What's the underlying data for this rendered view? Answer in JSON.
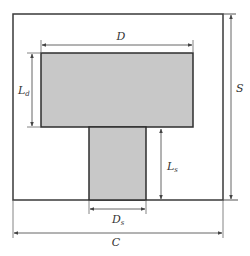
{
  "diagram": {
    "colors": {
      "outline": "#3a3a3a",
      "fill": "#c8c8c8",
      "dimension_line": "#555555",
      "background": "#ffffff"
    },
    "shapes": {
      "outer_square": {
        "label": "outer-boundary"
      },
      "top_rect": {
        "label": "top-block"
      },
      "stem_rect": {
        "label": "stem-block"
      }
    },
    "labels": {
      "D": {
        "main": "D",
        "sub": ""
      },
      "Ld": {
        "main": "L",
        "sub": "d"
      },
      "Ls": {
        "main": "L",
        "sub": "s"
      },
      "Ds": {
        "main": "D",
        "sub": "s"
      },
      "C": {
        "main": "C",
        "sub": ""
      },
      "S": {
        "main": "S",
        "sub": ""
      }
    }
  }
}
